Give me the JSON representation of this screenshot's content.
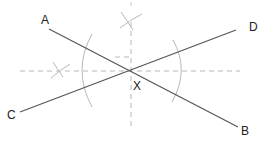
{
  "diagram": {
    "type": "geometric-construction",
    "labels": {
      "A": "A",
      "B": "B",
      "C": "C",
      "D": "D",
      "X": "X"
    },
    "colors": {
      "line": "#555555",
      "arc": "#b8b8b8",
      "dashed": "#b8b8b8",
      "text": "#222222",
      "background": "#ffffff"
    },
    "points": {
      "A": [
        48,
        29
      ],
      "B": [
        238,
        127
      ],
      "C": [
        20,
        112
      ],
      "D": [
        236,
        30
      ],
      "X": [
        131,
        70
      ]
    }
  }
}
